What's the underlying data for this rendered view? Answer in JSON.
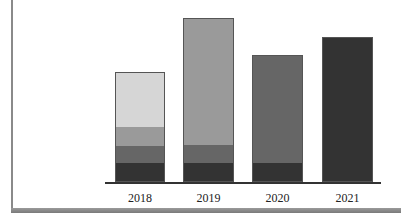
{
  "chart_data": {
    "type": "bar",
    "stacked": true,
    "title": "",
    "xlabel": "",
    "ylabel": "",
    "categories": [
      "2018",
      "2019",
      "2020",
      "2021"
    ],
    "series": [
      {
        "name": "Segment 1 (darkest)",
        "color": "#333333",
        "values": [
          18,
          18,
          18,
          145
        ]
      },
      {
        "name": "Segment 2 (dark gray)",
        "color": "#666666",
        "values": [
          18,
          18,
          109,
          0
        ]
      },
      {
        "name": "Segment 3 (mid gray)",
        "color": "#9a9a9a",
        "values": [
          19,
          128,
          0,
          0
        ]
      },
      {
        "name": "Segment 4 (light gray)",
        "color": "#d6d6d6",
        "values": [
          55,
          0,
          0,
          0
        ]
      }
    ],
    "totals": [
      110,
      164,
      127,
      145
    ],
    "ylim": [
      0,
      170
    ],
    "grid": false,
    "legend": "none",
    "units_note": "Relative heights in pixels; no y-axis shown"
  },
  "layout": {
    "baseline_y": 182,
    "bars": [
      {
        "x": 115,
        "width": 50
      },
      {
        "x": 183,
        "width": 51
      },
      {
        "x": 252,
        "width": 51
      },
      {
        "x": 322,
        "width": 51
      }
    ]
  }
}
